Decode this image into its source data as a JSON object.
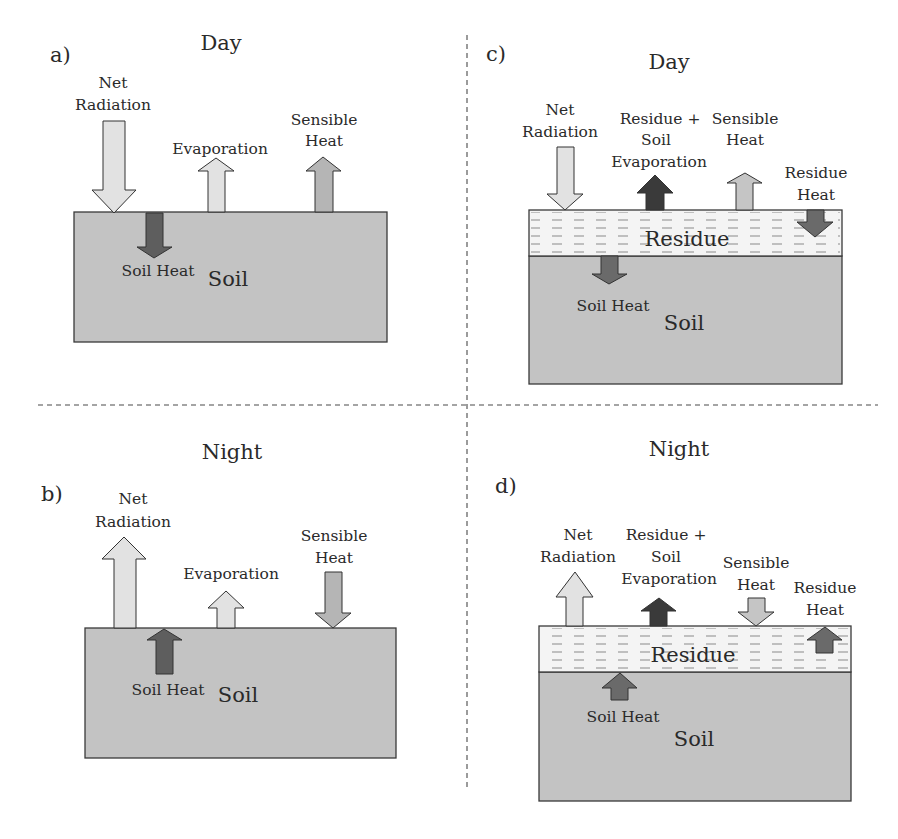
{
  "colors": {
    "soil": "#c3c3c3",
    "residue": "#f4f4f4",
    "arrow_light": "#e2e2e2",
    "arrow_medium": "#b5b5b5",
    "arrow_dark": "#5e5e5e",
    "arrow_darkest": "#3a3a3a",
    "text": "#2a2a2a"
  },
  "panels": {
    "a": {
      "letter": "a)",
      "period": "Day",
      "surface": "Soil",
      "fluxes": {
        "net_radiation": [
          "Net",
          "Radiation"
        ],
        "evaporation": "Evaporation",
        "sensible_heat": [
          "Sensible",
          "Heat"
        ],
        "soil_heat": "Soil Heat"
      }
    },
    "b": {
      "letter": "b)",
      "period": "Night",
      "surface": "Soil",
      "fluxes": {
        "net_radiation": [
          "Net",
          "Radiation"
        ],
        "evaporation": "Evaporation",
        "sensible_heat": [
          "Sensible",
          "Heat"
        ],
        "soil_heat": "Soil Heat"
      }
    },
    "c": {
      "letter": "c)",
      "period": "Day",
      "surface": "Soil",
      "layer": "Residue",
      "fluxes": {
        "net_radiation": [
          "Net",
          "Radiation"
        ],
        "evaporation": [
          "Residue +",
          "Soil",
          "Evaporation"
        ],
        "sensible_heat": [
          "Sensible",
          "Heat"
        ],
        "residue_heat": [
          "Residue",
          "Heat"
        ],
        "soil_heat": "Soil Heat"
      }
    },
    "d": {
      "letter": "d)",
      "period": "Night",
      "surface": "Soil",
      "layer": "Residue",
      "fluxes": {
        "net_radiation": [
          "Net",
          "Radiation"
        ],
        "evaporation": [
          "Residue +",
          "Soil",
          "Evaporation"
        ],
        "sensible_heat": [
          "Sensible",
          "Heat"
        ],
        "residue_heat": [
          "Residue",
          "Heat"
        ],
        "soil_heat": "Soil Heat"
      }
    }
  }
}
